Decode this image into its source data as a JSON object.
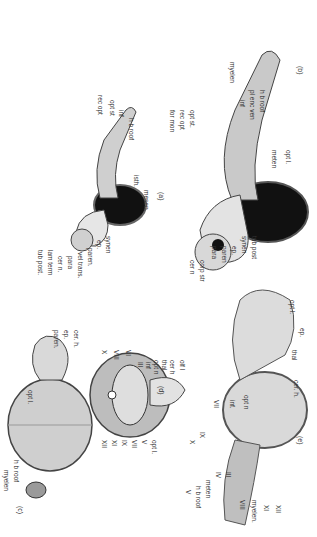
{
  "figure": {
    "panels": {
      "a": {
        "caption": "(a)",
        "labels": [
          "mesen.",
          "isth.",
          "h b roof",
          "inf",
          "opt st",
          "rec opt",
          "synen",
          "ep.",
          "paren.",
          "vel trans.",
          "para",
          "cer n.",
          "lam term",
          "tub post."
        ]
      },
      "b": {
        "caption": "(b)",
        "labels": [
          "opt l.",
          "meten",
          "h b roof",
          "pl enc ven",
          "inf",
          "myelen",
          "opt st.",
          "rec opt",
          "for mon",
          "tub post",
          "synen",
          "ep.",
          "paren",
          "para",
          "corp str",
          "cer n"
        ]
      },
      "c": {
        "caption": "(c)",
        "labels": [
          "cer. h.",
          "ep.",
          "paren.",
          "opt l.",
          "h b roof",
          "myelen"
        ]
      },
      "d": {
        "caption": "(d)",
        "labels": [
          "olf l",
          "cer h",
          "thal",
          "opt n",
          "inf",
          "III",
          "VI",
          "VIII",
          "X",
          "opt l.",
          "V",
          "VII",
          "IX",
          "XI",
          "XII"
        ]
      },
      "e": {
        "caption": "(e)",
        "labels": [
          "opt l.",
          "ep.",
          "thal",
          "cer. h.",
          "opt n",
          "inf.",
          "VII",
          "IX",
          "X",
          "III",
          "IV",
          "meten",
          "h b roof",
          "V",
          "VIII",
          "myelen.",
          "XI",
          "XII"
        ]
      }
    }
  }
}
